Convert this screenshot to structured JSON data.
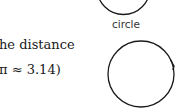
{
  "text": {
    "line1": "he distance",
    "line2": "π ≈ 3.14)"
  },
  "figures": {
    "top_circle_label": "circle"
  },
  "colors": {
    "stroke": "#1a1a1a",
    "text": "#1a1a1a"
  }
}
